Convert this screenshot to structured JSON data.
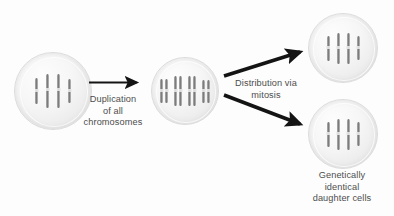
{
  "diagram": {
    "background_color": "#fdfdfd",
    "chromosome_color": "#7c7c7c",
    "cell_fill_color": "#f2f2f2",
    "arrow_color": "#1a1a1a",
    "text_color": "#4d4d4d"
  },
  "labels": {
    "duplication": "Duplication\nof all\nchromosomes",
    "distribution": "Distribution via\nmitosis",
    "daughter_cells": "Genetically\nidentical\ndaughter cells"
  },
  "cells": [
    {
      "id": "parent-cell",
      "name": "Parent cell",
      "chromosome_count": 4,
      "chromatids_per_chromosome": 1,
      "chromosomes": [
        {
          "height": 26,
          "label": "chromosome-1"
        },
        {
          "height": 34,
          "label": "chromosome-2"
        },
        {
          "height": 34,
          "label": "chromosome-3"
        },
        {
          "height": 24,
          "label": "chromosome-4"
        }
      ]
    },
    {
      "id": "duplicated-cell",
      "name": "Cell with duplicated chromosomes",
      "chromosome_count": 4,
      "chromatids_per_chromosome": 2,
      "chromosomes": [
        {
          "height": 24,
          "label": "duplicated-chromosome-1"
        },
        {
          "height": 30,
          "label": "duplicated-chromosome-2"
        },
        {
          "height": 30,
          "label": "duplicated-chromosome-3"
        },
        {
          "height": 23,
          "label": "duplicated-chromosome-4"
        }
      ]
    },
    {
      "id": "daughter-cell-top",
      "name": "Daughter cell (top)",
      "chromosome_count": 4,
      "chromatids_per_chromosome": 1,
      "chromosomes": [
        {
          "height": 25,
          "label": "chromosome-1"
        },
        {
          "height": 31,
          "label": "chromosome-2"
        },
        {
          "height": 31,
          "label": "chromosome-3"
        },
        {
          "height": 24,
          "label": "chromosome-4"
        }
      ]
    },
    {
      "id": "daughter-cell-bottom",
      "name": "Daughter cell (bottom)",
      "chromosome_count": 4,
      "chromatids_per_chromosome": 1,
      "chromosomes": [
        {
          "height": 25,
          "label": "chromosome-1"
        },
        {
          "height": 31,
          "label": "chromosome-2"
        },
        {
          "height": 31,
          "label": "chromosome-3"
        },
        {
          "height": 24,
          "label": "chromosome-4"
        }
      ]
    }
  ],
  "arrows": [
    {
      "id": "arrow-duplication",
      "from": "parent-cell",
      "to": "duplicated-cell",
      "direction": "right"
    },
    {
      "id": "arrow-mitosis-up",
      "from": "duplicated-cell",
      "to": "daughter-cell-top",
      "direction": "up-right"
    },
    {
      "id": "arrow-mitosis-down",
      "from": "duplicated-cell",
      "to": "daughter-cell-bottom",
      "direction": "down-right"
    }
  ]
}
